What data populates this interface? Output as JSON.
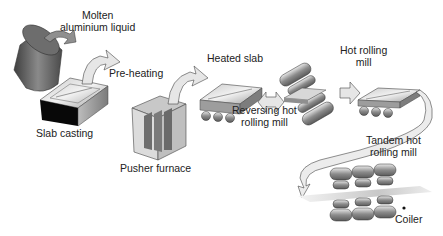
{
  "diagram": {
    "type": "process-flow",
    "labels": {
      "molten_line1": "Molten",
      "molten_line2": "aluminium liquid",
      "slab_casting": "Slab casting",
      "pre_heating": "Pre-heating",
      "pusher_furnace": "Pusher furnace",
      "heated_slab": "Heated slab",
      "reversing_line1": "Reversing hot",
      "reversing_line2": "rolling mill",
      "hot_rolling_line1": "Hot rolling",
      "hot_rolling_line2": "mill",
      "tandem_line1": "Tandem hot",
      "tandem_line2": "rolling mill",
      "coiler": "Coiler"
    },
    "steps": [
      {
        "name": "Molten aluminium liquid"
      },
      {
        "name": "Slab casting"
      },
      {
        "name": "Pre-heating"
      },
      {
        "name": "Pusher furnace"
      },
      {
        "name": "Heated slab"
      },
      {
        "name": "Reversing hot rolling mill"
      },
      {
        "name": "Hot rolling mill"
      },
      {
        "name": "Tandem hot rolling mill"
      },
      {
        "name": "Coiler"
      }
    ],
    "colors": {
      "metal_dark": "#555555",
      "metal_mid": "#9a9a9a",
      "metal_light": "#d8d8d8",
      "black_face": "#0a0a0a",
      "arrow_fill": "#e6e6e6",
      "outline": "#333333"
    }
  }
}
